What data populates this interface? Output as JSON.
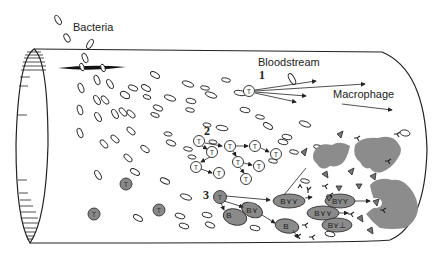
{
  "figure": {
    "labels": {
      "bacteria": "Bacteria",
      "bloodstream": "Bloodstream",
      "macrophage": "Macrophage"
    },
    "steps": {
      "step1": "1",
      "step2": "2",
      "step3": "3"
    },
    "cell_letters": {
      "t_cell": "T",
      "b_cell": "B",
      "b_cell_with_antibodies_1": "B⋎⋎",
      "b_cell_with_antibodies_2": "BYY",
      "b_cell_with_antibodies_3": "B⋎⋎",
      "b_cell_with_antibodies_4": "B⋎⊥",
      "b_cell_small": "B⋎"
    },
    "colors": {
      "line": "#222222",
      "activated_cell": "#888888",
      "macrophage": "#8c8c8c",
      "background": "#ffffff"
    }
  }
}
